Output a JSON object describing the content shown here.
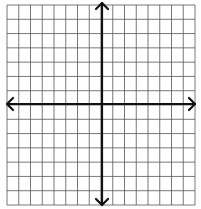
{
  "diagram": {
    "type": "coordinate-plane",
    "grid": {
      "columns": 16,
      "rows": 14,
      "left": 7,
      "top": 5,
      "right": 195,
      "bottom": 205,
      "line_color": "#555555",
      "line_width": 0.8
    },
    "axes": {
      "origin_x": 102,
      "origin_y": 104,
      "color": "#111111",
      "width": 2.2,
      "x_axis": {
        "from": 7,
        "to": 195,
        "arrows": "both"
      },
      "y_axis": {
        "from": 3,
        "to": 205,
        "arrows": "both"
      }
    }
  }
}
